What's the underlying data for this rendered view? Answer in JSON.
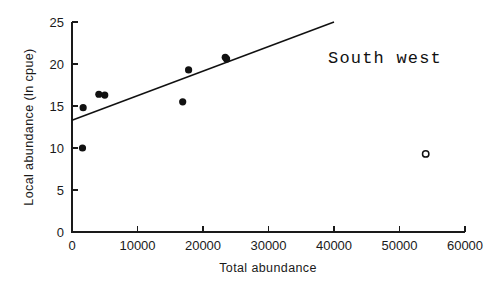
{
  "chart_data": {
    "type": "scatter",
    "title": "",
    "annotation": "South west",
    "xlabel": "Total abundance",
    "ylabel": "Local abundance (ln cpue)",
    "xlim": [
      0,
      60000
    ],
    "ylim": [
      0,
      25
    ],
    "xticks": [
      0,
      10000,
      20000,
      30000,
      40000,
      50000,
      60000
    ],
    "xticklabels": [
      "0",
      "10000",
      "20000",
      "30000",
      "40000",
      "50000",
      "60000"
    ],
    "yticks": [
      0,
      5,
      10,
      15,
      20,
      25
    ],
    "yticklabels": [
      "0",
      "5",
      "10",
      "15",
      "20",
      "25"
    ],
    "grid": false,
    "legend": null,
    "series": [
      {
        "name": "included points",
        "marker": "filled-circle",
        "color": "#111111",
        "points": [
          {
            "x": 1600,
            "y": 10.0
          },
          {
            "x": 1700,
            "y": 14.8
          },
          {
            "x": 4100,
            "y": 16.4
          },
          {
            "x": 5000,
            "y": 16.3
          },
          {
            "x": 16900,
            "y": 15.5
          },
          {
            "x": 17800,
            "y": 19.3
          },
          {
            "x": 23400,
            "y": 20.8
          },
          {
            "x": 23600,
            "y": 20.6
          }
        ]
      },
      {
        "name": "excluded outlier",
        "marker": "open-circle",
        "color": "#111111",
        "points": [
          {
            "x": 54000,
            "y": 9.3
          }
        ]
      }
    ],
    "fit_line": {
      "name": "regression line",
      "x_start": 0,
      "y_start": 13.3,
      "x_end": 40000,
      "y_end": 25.0
    }
  },
  "labels": {
    "annotation": "South west",
    "xlabel": "Total abundance",
    "ylabel": "Local abundance (ln cpue)"
  }
}
